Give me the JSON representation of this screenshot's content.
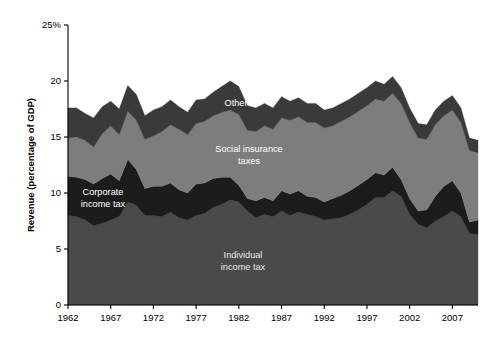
{
  "chart_data": {
    "type": "area",
    "stacked": true,
    "title": "",
    "xlabel": "",
    "ylabel": "Revenue (percentage of GDP)",
    "ylim": [
      0,
      25
    ],
    "xlim": [
      1962,
      2010
    ],
    "yticks": [
      0,
      5,
      10,
      15,
      20,
      25
    ],
    "ytick_labels": [
      "0",
      "5",
      "10",
      "15",
      "20",
      "25%"
    ],
    "xticks": [
      1962,
      1967,
      1972,
      1977,
      1982,
      1987,
      1992,
      1997,
      2002,
      2007
    ],
    "xtick_labels": [
      "1962",
      "1967",
      "1972",
      "1977",
      "1982",
      "1987",
      "1992",
      "1997",
      "2002",
      "2007"
    ],
    "grid": false,
    "legend_position": "inline-annotations",
    "x": [
      1962,
      1963,
      1964,
      1965,
      1966,
      1967,
      1968,
      1969,
      1970,
      1971,
      1972,
      1973,
      1974,
      1975,
      1976,
      1977,
      1978,
      1979,
      1980,
      1981,
      1982,
      1983,
      1984,
      1985,
      1986,
      1987,
      1988,
      1989,
      1990,
      1991,
      1992,
      1993,
      1994,
      1995,
      1996,
      1997,
      1998,
      1999,
      2000,
      2001,
      2002,
      2003,
      2004,
      2005,
      2006,
      2007,
      2008,
      2009,
      2010
    ],
    "series": [
      {
        "name": "Individual income tax",
        "color": "#4a4a4a",
        "values": [
          8.0,
          7.9,
          7.6,
          7.1,
          7.3,
          7.6,
          7.9,
          9.2,
          8.9,
          8.0,
          8.0,
          7.9,
          8.3,
          7.8,
          7.6,
          8.0,
          8.2,
          8.7,
          9.0,
          9.4,
          9.2,
          8.4,
          7.8,
          8.1,
          7.9,
          8.4,
          8.0,
          8.3,
          8.1,
          7.9,
          7.6,
          7.7,
          7.8,
          8.1,
          8.5,
          9.0,
          9.6,
          9.6,
          10.2,
          9.7,
          8.1,
          7.2,
          6.9,
          7.5,
          7.9,
          8.4,
          7.9,
          6.4,
          6.3
        ]
      },
      {
        "name": "Corporate income tax",
        "color": "#1c1c1c",
        "values": [
          3.5,
          3.5,
          3.6,
          3.7,
          4.0,
          4.1,
          3.2,
          3.8,
          3.2,
          2.4,
          2.6,
          2.7,
          2.6,
          2.5,
          2.4,
          2.8,
          2.7,
          2.6,
          2.4,
          2.0,
          1.5,
          1.1,
          1.5,
          1.5,
          1.4,
          1.8,
          1.9,
          1.9,
          1.6,
          1.7,
          1.6,
          1.8,
          2.0,
          2.1,
          2.2,
          2.2,
          2.2,
          2.0,
          2.1,
          1.5,
          1.4,
          1.2,
          1.6,
          2.2,
          2.7,
          2.7,
          2.1,
          1.0,
          1.3
        ]
      },
      {
        "name": "Social insurance taxes",
        "color": "#7d7d7d",
        "values": [
          3.4,
          3.6,
          3.5,
          3.3,
          4.0,
          4.3,
          4.1,
          4.3,
          4.4,
          4.4,
          4.5,
          4.9,
          5.2,
          5.4,
          5.2,
          5.4,
          5.5,
          5.6,
          5.8,
          6.0,
          6.3,
          6.1,
          6.2,
          6.4,
          6.4,
          6.5,
          6.6,
          6.6,
          6.6,
          6.7,
          6.6,
          6.5,
          6.6,
          6.6,
          6.6,
          6.6,
          6.6,
          6.6,
          6.6,
          6.8,
          6.8,
          6.5,
          6.3,
          6.4,
          6.3,
          6.3,
          6.3,
          6.4,
          6.0
        ]
      },
      {
        "name": "Other",
        "color": "#3a3a3a",
        "values": [
          2.7,
          2.6,
          2.4,
          2.6,
          2.4,
          2.2,
          2.3,
          2.3,
          2.3,
          2.1,
          2.3,
          2.2,
          2.2,
          2.0,
          2.0,
          2.1,
          2.0,
          2.1,
          2.3,
          2.6,
          2.5,
          2.2,
          2.1,
          2.0,
          1.9,
          1.9,
          1.7,
          1.7,
          1.7,
          1.7,
          1.6,
          1.6,
          1.6,
          1.6,
          1.6,
          1.6,
          1.6,
          1.5,
          1.5,
          1.4,
          1.3,
          1.3,
          1.3,
          1.3,
          1.3,
          1.3,
          1.3,
          1.1,
          1.1
        ]
      }
    ],
    "annotations": [
      {
        "name": "other-label",
        "text": "Other",
        "x_px": 236,
        "y_px": 106
      },
      {
        "name": "social-insurance-label-line1",
        "text": "Social insurance",
        "x_px": 249,
        "y_px": 152
      },
      {
        "name": "social-insurance-label-line2",
        "text": "taxes",
        "x_px": 249,
        "y_px": 164
      },
      {
        "name": "corporate-label-line1",
        "text": "Corporate",
        "x_px": 103,
        "y_px": 195
      },
      {
        "name": "corporate-label-line2",
        "text": "income tax",
        "x_px": 103,
        "y_px": 207
      },
      {
        "name": "individual-label-line1",
        "text": "Individual",
        "x_px": 243,
        "y_px": 258
      },
      {
        "name": "individual-label-line2",
        "text": "income tax",
        "x_px": 243,
        "y_px": 270
      }
    ]
  }
}
